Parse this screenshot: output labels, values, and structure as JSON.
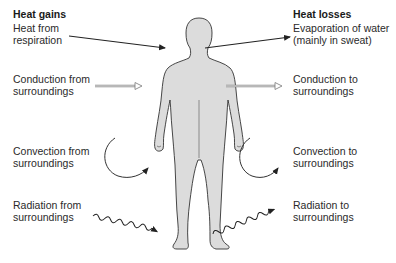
{
  "diagram": {
    "figure": {
      "type": "human-body-silhouette",
      "fill": "#dcdcdc",
      "stroke": "#333333"
    },
    "gains": {
      "header": "Heat gains",
      "items": [
        {
          "line1": "Heat from",
          "line2": "respiration",
          "arrow": "straight-solid"
        },
        {
          "line1": "Conduction from",
          "line2": "surroundings",
          "arrow": "hollow-double"
        },
        {
          "line1": "Convection from",
          "line2": "surroundings",
          "arrow": "curved"
        },
        {
          "line1": "Radiation from",
          "line2": "surroundings",
          "arrow": "wavy"
        }
      ]
    },
    "losses": {
      "header": "Heat losses",
      "items": [
        {
          "line1": "Evaporation of water",
          "line2": "(mainly in sweat)",
          "arrow": "straight-solid"
        },
        {
          "line1": "Conduction to",
          "line2": "surroundings",
          "arrow": "hollow-double"
        },
        {
          "line1": "Convection to",
          "line2": "surroundings",
          "arrow": "curved"
        },
        {
          "line1": "Radiation to",
          "line2": "surroundings",
          "arrow": "wavy"
        }
      ]
    }
  }
}
